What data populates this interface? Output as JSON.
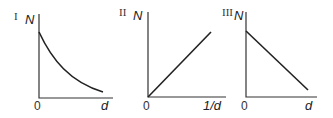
{
  "panels": [
    {
      "numeral": "I",
      "y_label": "N",
      "x_origin_label": "0",
      "x_label": "d",
      "relationship": "exponential-decay"
    },
    {
      "numeral": "II",
      "y_label": "N",
      "x_origin_label": "0",
      "x_label": "1/d",
      "relationship": "linear-increasing-through-origin"
    },
    {
      "numeral": "III",
      "y_label": "N",
      "x_origin_label": "0",
      "x_label": "d",
      "relationship": "linear-decreasing"
    }
  ],
  "colors": {
    "line": "#222222",
    "axis": "#333333",
    "background": "#ffffff"
  }
}
